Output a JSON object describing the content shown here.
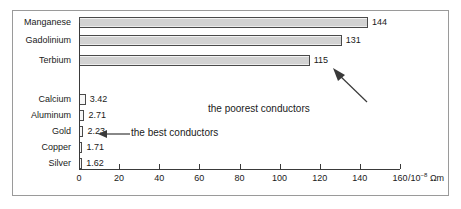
{
  "chart_data": {
    "type": "bar",
    "orientation": "horizontal",
    "title": "",
    "xlabel": "/10⁻⁸ Ωm",
    "ylabel": "",
    "xlim": [
      0,
      160
    ],
    "xticks": [
      0,
      20,
      40,
      60,
      80,
      100,
      120,
      140,
      160
    ],
    "grid": false,
    "legend": false,
    "categories": [
      "Manganese",
      "Gadolinium",
      "Terbium",
      "Calcium",
      "Aluminum",
      "Gold",
      "Copper",
      "Silver"
    ],
    "values": [
      144,
      131,
      115,
      3.42,
      2.71,
      2.23,
      1.71,
      1.62
    ],
    "value_labels": [
      "144",
      "131",
      "115",
      "3.42",
      "2.71",
      "2.23",
      "1.71",
      "1.62"
    ],
    "annotations": [
      {
        "text": "the poorest conductors",
        "arrow": "up-left"
      },
      {
        "text": "the best conductors",
        "arrow": "left"
      }
    ]
  },
  "axis": {
    "unit_prefix": "/10",
    "unit_exponent": "−8",
    "unit_suffix": "Ωm",
    "tick_labels": [
      "0",
      "20",
      "40",
      "60",
      "80",
      "100",
      "120",
      "140",
      "160"
    ]
  },
  "bars": [
    {
      "label": "Manganese",
      "value_label": "144"
    },
    {
      "label": "Gadolinium",
      "value_label": "131"
    },
    {
      "label": "Terbium",
      "value_label": "115"
    },
    {
      "label": "Calcium",
      "value_label": "3.42"
    },
    {
      "label": "Aluminum",
      "value_label": "2.71"
    },
    {
      "label": "Gold",
      "value_label": "2.23"
    },
    {
      "label": "Copper",
      "value_label": "1.71"
    },
    {
      "label": "Silver",
      "value_label": "1.62"
    }
  ],
  "annotations": {
    "poorest": "the poorest conductors",
    "best": "the best conductors"
  },
  "colors": {
    "bar_fill": "#d2d2d2",
    "bar_border": "#4a4a4a",
    "axis": "#3a3a3a",
    "frame": "#9a9a9a",
    "text": "#1a1a1a"
  }
}
